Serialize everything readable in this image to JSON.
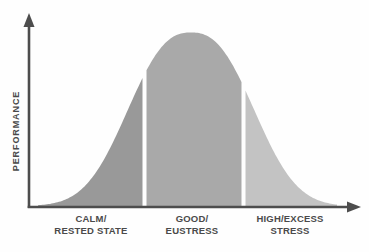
{
  "chart_data": {
    "type": "area",
    "title": "",
    "xlabel": "",
    "ylabel": "PERFORMANCE",
    "grid": false,
    "legend": "none",
    "curve": {
      "shape": "flattened-gaussian",
      "center_x": 191,
      "width_param": 78,
      "exponent": 2.5,
      "peak_height": 173.5,
      "x_start": 38,
      "x_end": 337
    },
    "axis": {
      "color": "#4d4d4d",
      "baseline_y": 207,
      "yaxis_x": 29,
      "x_arrow_tip_x": 361,
      "y_arrow_tip_y": 13
    },
    "sections": [
      {
        "name": "calm-rested",
        "x_from": 38,
        "x_to": 142.5,
        "color": "#999999"
      },
      {
        "name": "good-eustress",
        "x_from": 146.5,
        "x_to": 241.5,
        "color": "#a9a9a9"
      },
      {
        "name": "high-excess",
        "x_from": 245.5,
        "x_to": 337,
        "color": "#c3c3c3"
      }
    ],
    "categories": [
      {
        "line1": "CALM/",
        "line2": "RESTED STATE",
        "center_x": 91
      },
      {
        "line1": "GOOD/",
        "line2": "EUSTRESS",
        "center_x": 192
      },
      {
        "line1": "HIGH/EXCESS",
        "line2": "STRESS",
        "center_x": 290
      }
    ]
  }
}
